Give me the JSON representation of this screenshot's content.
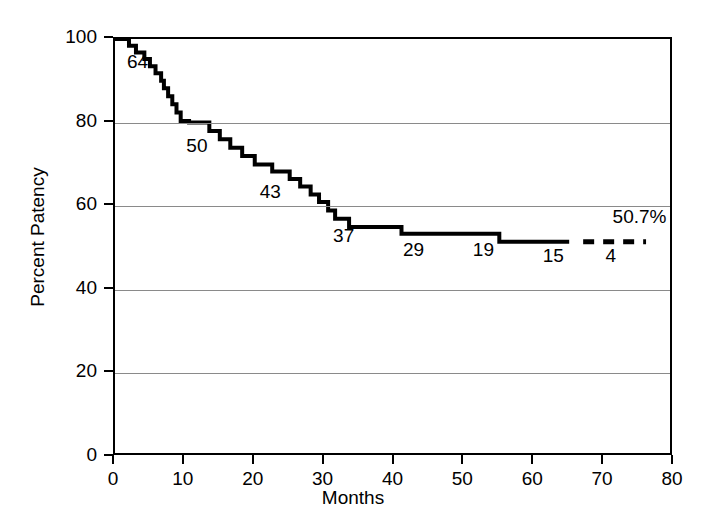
{
  "chart_data": {
    "type": "line",
    "subtype": "kaplan-meier-step",
    "title": "",
    "xlabel": "Months",
    "ylabel": "Percent Patency",
    "xlim": [
      0,
      80
    ],
    "ylim": [
      0,
      100
    ],
    "xticks": [
      0,
      10,
      20,
      30,
      40,
      50,
      60,
      70,
      80
    ],
    "yticks": [
      0,
      20,
      40,
      60,
      80,
      100
    ],
    "xtick_labels": [
      "0",
      "10",
      "20",
      "30",
      "40",
      "50",
      "60",
      "70",
      "80"
    ],
    "ytick_labels": [
      "0",
      "20",
      "40",
      "60",
      "80",
      "100"
    ],
    "grid": "horizontal",
    "legend": "none",
    "series": [
      {
        "name": "Percent Patency",
        "style": "solid",
        "points": [
          [
            0,
            100
          ],
          [
            2.0,
            100
          ],
          [
            2.0,
            98.4
          ],
          [
            3.0,
            98.4
          ],
          [
            3.0,
            96.8
          ],
          [
            4.2,
            96.8
          ],
          [
            4.2,
            95.2
          ],
          [
            5.0,
            95.2
          ],
          [
            5.0,
            93.5
          ],
          [
            5.8,
            93.5
          ],
          [
            5.8,
            91.8
          ],
          [
            6.6,
            91.8
          ],
          [
            6.6,
            90.0
          ],
          [
            7.0,
            90.0
          ],
          [
            7.0,
            88.2
          ],
          [
            7.6,
            88.2
          ],
          [
            7.6,
            86.3
          ],
          [
            8.2,
            86.3
          ],
          [
            8.2,
            84.4
          ],
          [
            8.8,
            84.4
          ],
          [
            8.8,
            82.4
          ],
          [
            9.4,
            82.4
          ],
          [
            9.4,
            80.4
          ],
          [
            10.6,
            80.4
          ],
          [
            10.6,
            80.0
          ],
          [
            13.5,
            80.0
          ],
          [
            13.5,
            78.0
          ],
          [
            15.0,
            78.0
          ],
          [
            15.0,
            76.0
          ],
          [
            16.5,
            76.0
          ],
          [
            16.5,
            74.0
          ],
          [
            18.2,
            74.0
          ],
          [
            18.2,
            72.0
          ],
          [
            20.0,
            72.0
          ],
          [
            20.0,
            70.0
          ],
          [
            22.5,
            70.0
          ],
          [
            22.5,
            68.3
          ],
          [
            25.0,
            68.3
          ],
          [
            25.0,
            66.5
          ],
          [
            26.5,
            66.5
          ],
          [
            26.5,
            64.7
          ],
          [
            28.0,
            64.7
          ],
          [
            28.0,
            62.8
          ],
          [
            29.2,
            62.8
          ],
          [
            29.2,
            61.0
          ],
          [
            30.5,
            61.0
          ],
          [
            30.5,
            59.0
          ],
          [
            31.5,
            59.0
          ],
          [
            31.5,
            57.0
          ],
          [
            33.5,
            57.0
          ],
          [
            33.5,
            55.0
          ],
          [
            41.0,
            55.0
          ],
          [
            41.0,
            53.4
          ],
          [
            55.0,
            53.4
          ],
          [
            55.0,
            51.5
          ],
          [
            65.0,
            51.5
          ]
        ]
      },
      {
        "name": "Percent Patency (projected)",
        "style": "dashed",
        "points": [
          [
            67.0,
            51.5
          ],
          [
            76.0,
            51.5
          ]
        ]
      }
    ],
    "annotations": [
      {
        "text": "64",
        "x": 2.0,
        "y": 94.0,
        "role": "at-risk-count"
      },
      {
        "text": "50",
        "x": 10.5,
        "y": 74.0,
        "role": "at-risk-count"
      },
      {
        "text": "43",
        "x": 21.0,
        "y": 63.0,
        "role": "at-risk-count"
      },
      {
        "text": "37",
        "x": 31.5,
        "y": 52.5,
        "role": "at-risk-count"
      },
      {
        "text": "29",
        "x": 41.5,
        "y": 49.0,
        "role": "at-risk-count"
      },
      {
        "text": "19",
        "x": 51.5,
        "y": 49.0,
        "role": "at-risk-count"
      },
      {
        "text": "15",
        "x": 61.5,
        "y": 47.5,
        "role": "at-risk-count"
      },
      {
        "text": "4",
        "x": 70.5,
        "y": 47.5,
        "role": "at-risk-count"
      },
      {
        "text": "50.7%",
        "x": 71.5,
        "y": 57.0,
        "role": "final-value"
      }
    ],
    "final_value": "50.7%",
    "at_risk_counts": [
      64,
      50,
      43,
      37,
      29,
      19,
      15,
      4
    ],
    "colors": {
      "curve": "#000000",
      "axis": "#000000",
      "grid": "#8a8a8a",
      "background": "#ffffff"
    }
  }
}
